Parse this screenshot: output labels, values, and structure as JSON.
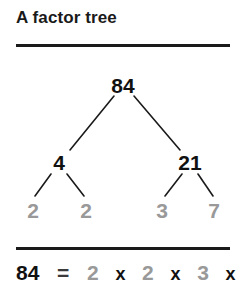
{
  "title": "A factor tree",
  "colors": {
    "text_dark": "#111111",
    "prime_gray": "#999999",
    "rule": "#1a1a1a",
    "background": "#ffffff"
  },
  "tree": {
    "root": {
      "label": "84",
      "kind": "composite"
    },
    "level2": [
      {
        "label": "4",
        "kind": "composite"
      },
      {
        "label": "21",
        "kind": "composite"
      }
    ],
    "leaves": [
      {
        "label": "2",
        "kind": "prime"
      },
      {
        "label": "2",
        "kind": "prime"
      },
      {
        "label": "3",
        "kind": "prime"
      },
      {
        "label": "7",
        "kind": "prime"
      }
    ]
  },
  "equation": {
    "product": "84",
    "equals": "=",
    "times": "x",
    "factors": [
      "2",
      "2",
      "3",
      "7"
    ]
  }
}
